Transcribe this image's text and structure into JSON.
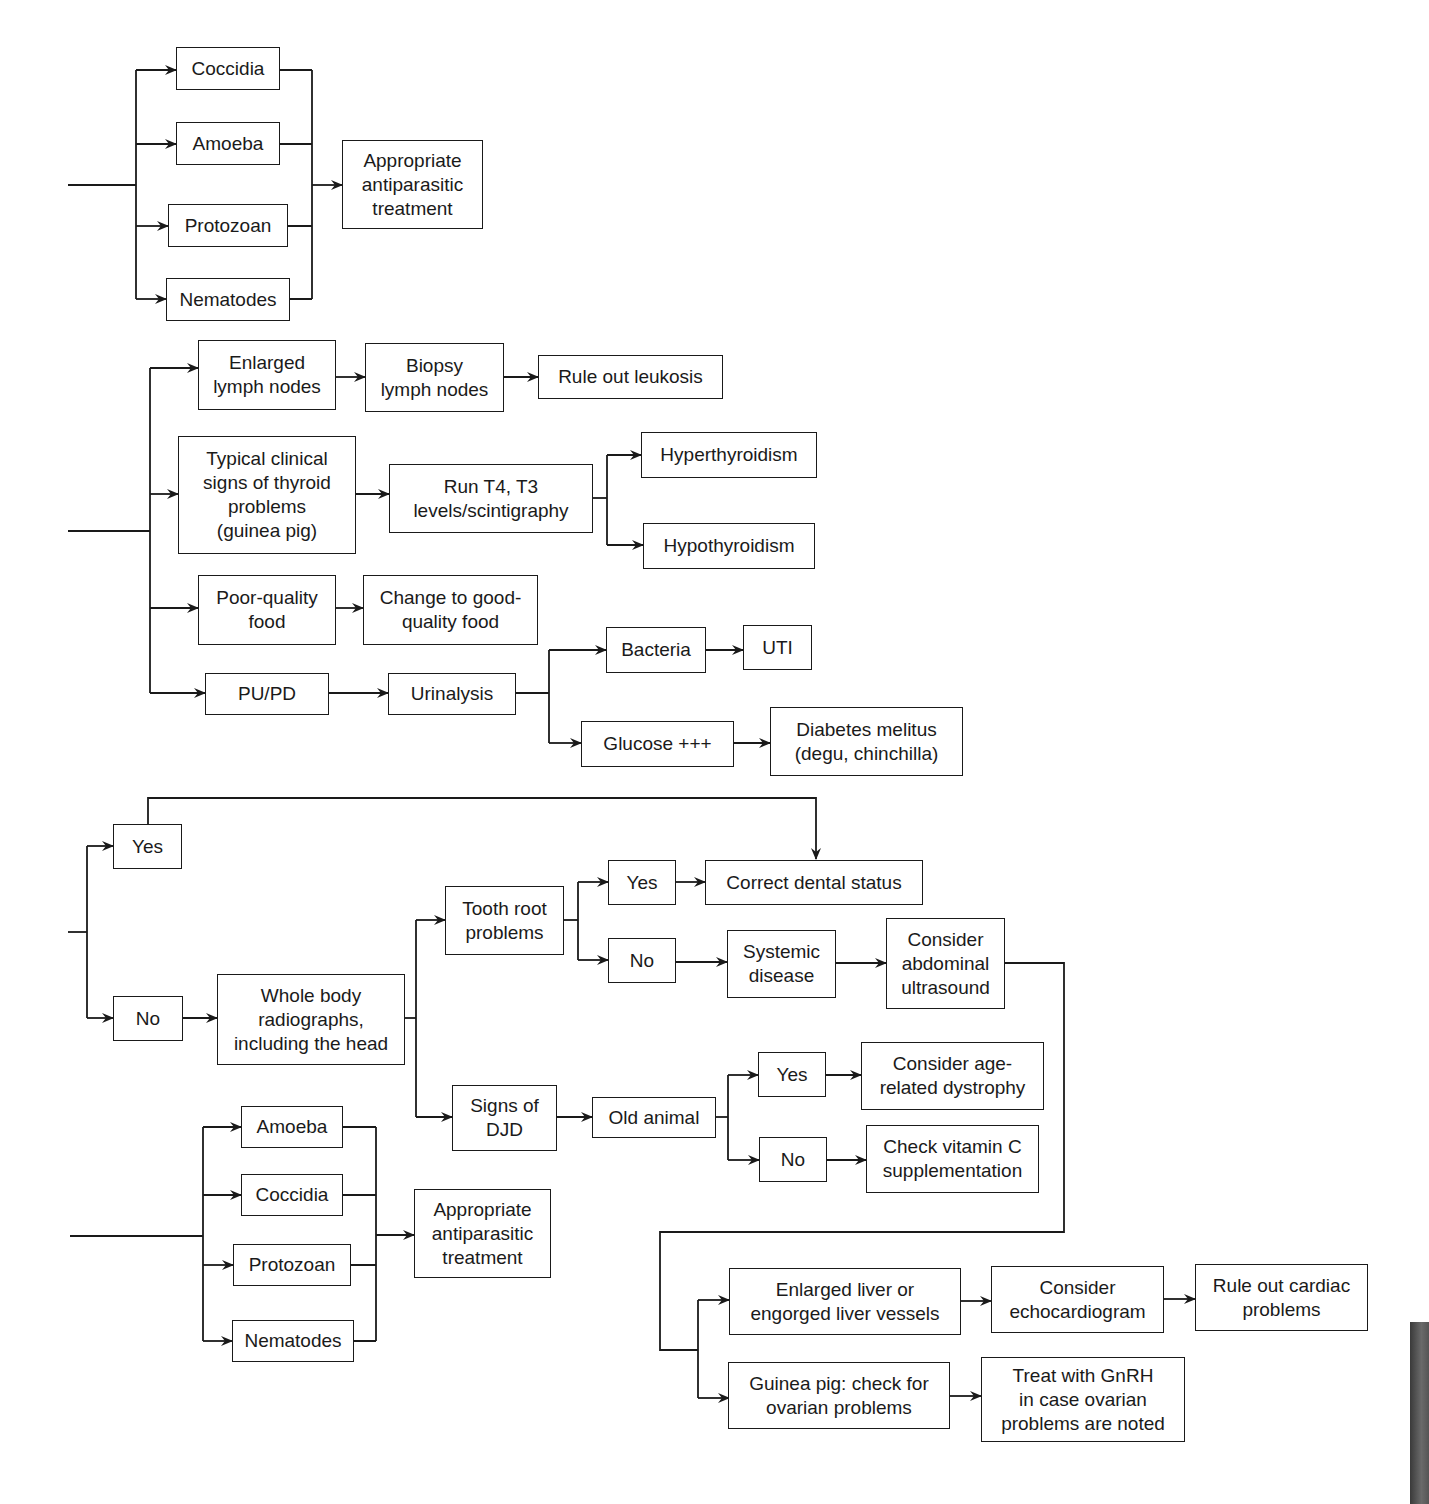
{
  "diagram": {
    "section1": {
      "parasites": [
        "Coccidia",
        "Amoeba",
        "Protozoan",
        "Nematodes"
      ],
      "treatment": "Appropriate\nantiparasitic\ntreatment"
    },
    "section2": {
      "lymph": "Enlarged\nlymph nodes",
      "biopsy": "Biopsy\nlymph nodes",
      "leukosis": "Rule out leukosis",
      "thyroid_signs": "Typical clinical\nsigns of thyroid\nproblems\n(guinea pig)",
      "run_t4": "Run T4, T3\nlevels/scintigraphy",
      "hyper": "Hyperthyroidism",
      "hypo": "Hypothyroidism",
      "poor_food": "Poor-quality\nfood",
      "good_food": "Change to good-\nquality food",
      "pupd": "PU/PD",
      "urinalysis": "Urinalysis",
      "bacteria": "Bacteria",
      "uti": "UTI",
      "glucose": "Glucose +++",
      "diabetes": "Diabetes melitus\n(degu, chinchilla)"
    },
    "section3": {
      "yes": "Yes",
      "no": "No",
      "radiographs": "Whole body\nradiographs,\nincluding the head",
      "tooth_root": "Tooth root\nproblems",
      "tr_yes": "Yes",
      "tr_no": "No",
      "correct_dental": "Correct dental status",
      "systemic": "Systemic\ndisease",
      "abdominal_us": "Consider\nabdominal\nultrasound",
      "djd": "Signs of\nDJD",
      "old_animal": "Old animal",
      "old_yes": "Yes",
      "old_no": "No",
      "age_dystrophy": "Consider age-\nrelated dystrophy",
      "vitamin_c": "Check vitamin C\nsupplementation",
      "enlarged_liver": "Enlarged liver or\nengorged liver vessels",
      "echocardiogram": "Consider\nechocardiogram",
      "cardiac": "Rule out cardiac\nproblems",
      "ovarian": "Guinea pig: check for\novarian problems",
      "gnrh": "Treat with GnRH\nin case ovarian\nproblems are noted"
    },
    "section4": {
      "parasites": [
        "Amoeba",
        "Coccidia",
        "Protozoan",
        "Nematodes"
      ],
      "treatment": "Appropriate\nantiparasitic\ntreatment"
    }
  }
}
